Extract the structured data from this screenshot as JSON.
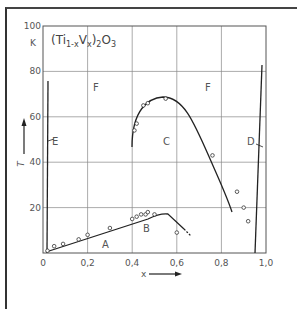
{
  "chart_data": {
    "type": "line",
    "title": "(Ti1-xVx)2O3",
    "formula": {
      "base": "(Ti",
      "sub1": "1-x",
      "mid": "V",
      "sub2": "x",
      "close": ")",
      "sub3": "2",
      "tail": "O",
      "sub4": "3"
    },
    "xlabel": "x",
    "ylabel": "T",
    "yunit": "K",
    "xlim": [
      0,
      1.0
    ],
    "ylim": [
      0,
      100
    ],
    "xticks": [
      "0",
      "0,2",
      "0,4",
      "0,6",
      "0,8",
      "1,0"
    ],
    "yticks": [
      "20",
      "40",
      "60",
      "80",
      "100"
    ],
    "grid": true,
    "region_labels": [
      "A",
      "B",
      "C",
      "D",
      "E",
      "F",
      "F"
    ],
    "series": [
      {
        "name": "A-B boundary (points)",
        "x": [
          0.02,
          0.05,
          0.09,
          0.16,
          0.2,
          0.3,
          0.4,
          0.42,
          0.44,
          0.46,
          0.47,
          0.5,
          0.6
        ],
        "y": [
          1,
          3,
          4,
          6,
          8,
          11,
          15,
          16,
          17,
          17,
          18,
          17,
          9
        ]
      },
      {
        "name": "C boundary (points)",
        "x": [
          0.41,
          0.42,
          0.45,
          0.47,
          0.55,
          0.76,
          0.87,
          0.9,
          0.92
        ],
        "y": [
          54,
          57,
          65,
          66,
          68,
          43,
          27,
          20,
          14
        ]
      },
      {
        "name": "E line",
        "x": [
          0.02,
          0.02
        ],
        "y": [
          0,
          82
        ]
      },
      {
        "name": "D line",
        "x": [
          0.96,
          0.99
        ],
        "y": [
          0,
          80
        ]
      }
    ]
  }
}
